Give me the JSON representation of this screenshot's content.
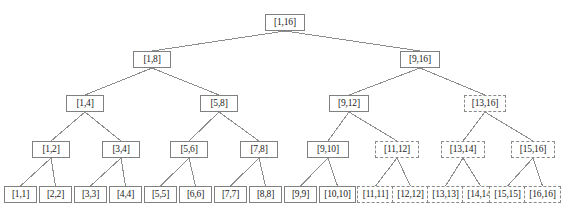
{
  "figure": {
    "name": "segment-tree-diagram",
    "type": "tree",
    "width": 563,
    "height": 209,
    "background": "#ffffff",
    "edge_color": "#8c8c8c",
    "solid_border_color": "#808080",
    "dashed_border_color": "#8a8a8a",
    "text_color": "#1a1a1a"
  },
  "levels": [
    {
      "index": 0,
      "y": 14,
      "height": 17,
      "font_size": 9.5
    },
    {
      "index": 1,
      "y": 51,
      "height": 17,
      "font_size": 9.5
    },
    {
      "index": 2,
      "y": 95,
      "height": 17,
      "font_size": 9.5
    },
    {
      "index": 3,
      "y": 141,
      "height": 17,
      "font_size": 9.5
    },
    {
      "index": 4,
      "y": 186,
      "height": 17,
      "font_size": 9.5
    }
  ],
  "nodes": [
    {
      "id": "n-1-16",
      "label": "[1,16]",
      "level": 0,
      "x": 265,
      "y": 14,
      "w": 40,
      "h": 17,
      "style": "solid",
      "range": [
        1,
        16
      ]
    },
    {
      "id": "n-1-8",
      "label": "[1,8]",
      "level": 1,
      "x": 133,
      "y": 51,
      "w": 38,
      "h": 17,
      "style": "solid",
      "range": [
        1,
        8
      ]
    },
    {
      "id": "n-9-16",
      "label": "[9,16]",
      "level": 1,
      "x": 400,
      "y": 51,
      "w": 40,
      "h": 17,
      "style": "solid",
      "range": [
        9,
        16
      ]
    },
    {
      "id": "n-1-4",
      "label": "[1,4]",
      "level": 2,
      "x": 66,
      "y": 95,
      "w": 38,
      "h": 17,
      "style": "solid",
      "range": [
        1,
        4
      ]
    },
    {
      "id": "n-5-8",
      "label": "[5,8]",
      "level": 2,
      "x": 200,
      "y": 95,
      "w": 38,
      "h": 17,
      "style": "solid",
      "range": [
        5,
        8
      ]
    },
    {
      "id": "n-9-12",
      "label": "[9,12]",
      "level": 2,
      "x": 329,
      "y": 95,
      "w": 40,
      "h": 17,
      "style": "solid",
      "range": [
        9,
        12
      ]
    },
    {
      "id": "n-13-16",
      "label": "[13,16]",
      "level": 2,
      "x": 464,
      "y": 95,
      "w": 42,
      "h": 17,
      "style": "dashed",
      "range": [
        13,
        16
      ]
    },
    {
      "id": "n-1-2",
      "label": "[1,2]",
      "level": 3,
      "x": 32,
      "y": 141,
      "w": 38,
      "h": 17,
      "style": "solid",
      "range": [
        1,
        2
      ]
    },
    {
      "id": "n-3-4",
      "label": "[3,4]",
      "level": 3,
      "x": 102,
      "y": 141,
      "w": 38,
      "h": 17,
      "style": "solid",
      "range": [
        3,
        4
      ]
    },
    {
      "id": "n-5-6",
      "label": "[5,6]",
      "level": 3,
      "x": 170,
      "y": 141,
      "w": 38,
      "h": 17,
      "style": "solid",
      "range": [
        5,
        6
      ]
    },
    {
      "id": "n-7-8",
      "label": "[7,8]",
      "level": 3,
      "x": 240,
      "y": 141,
      "w": 38,
      "h": 17,
      "style": "solid",
      "range": [
        7,
        8
      ]
    },
    {
      "id": "n-9-10",
      "label": "[9,10]",
      "level": 3,
      "x": 307,
      "y": 141,
      "w": 42,
      "h": 17,
      "style": "solid",
      "range": [
        9,
        10
      ]
    },
    {
      "id": "n-11-12",
      "label": "[11,12]",
      "level": 3,
      "x": 375,
      "y": 141,
      "w": 44,
      "h": 17,
      "style": "dashed",
      "range": [
        11,
        12
      ]
    },
    {
      "id": "n-13-14",
      "label": "[13,14]",
      "level": 3,
      "x": 441,
      "y": 141,
      "w": 44,
      "h": 17,
      "style": "dashed",
      "range": [
        13,
        14
      ]
    },
    {
      "id": "n-15-16",
      "label": "[15,16]",
      "level": 3,
      "x": 511,
      "y": 141,
      "w": 44,
      "h": 17,
      "style": "dashed",
      "range": [
        15,
        16
      ]
    },
    {
      "id": "n-1-1",
      "label": "[1,1]",
      "level": 4,
      "x": 4,
      "y": 186,
      "w": 33,
      "h": 17,
      "style": "solid",
      "range": [
        1,
        1
      ]
    },
    {
      "id": "n-2-2",
      "label": "[2,2]",
      "level": 4,
      "x": 39,
      "y": 186,
      "w": 33,
      "h": 17,
      "style": "solid",
      "range": [
        2,
        2
      ]
    },
    {
      "id": "n-3-3",
      "label": "[3,3]",
      "level": 4,
      "x": 74,
      "y": 186,
      "w": 33,
      "h": 17,
      "style": "solid",
      "range": [
        3,
        3
      ]
    },
    {
      "id": "n-4-4",
      "label": "[4,4]",
      "level": 4,
      "x": 109,
      "y": 186,
      "w": 33,
      "h": 17,
      "style": "solid",
      "range": [
        4,
        4
      ]
    },
    {
      "id": "n-5-5",
      "label": "[5,5]",
      "level": 4,
      "x": 144,
      "y": 186,
      "w": 33,
      "h": 17,
      "style": "solid",
      "range": [
        5,
        5
      ]
    },
    {
      "id": "n-6-6",
      "label": "[6,6]",
      "level": 4,
      "x": 179,
      "y": 186,
      "w": 33,
      "h": 17,
      "style": "solid",
      "range": [
        6,
        6
      ]
    },
    {
      "id": "n-7-7",
      "label": "[7,7]",
      "level": 4,
      "x": 214,
      "y": 186,
      "w": 33,
      "h": 17,
      "style": "solid",
      "range": [
        7,
        7
      ]
    },
    {
      "id": "n-8-8",
      "label": "[8,8]",
      "level": 4,
      "x": 249,
      "y": 186,
      "w": 33,
      "h": 17,
      "style": "solid",
      "range": [
        8,
        8
      ]
    },
    {
      "id": "n-9-9",
      "label": "[9,9]",
      "level": 4,
      "x": 284,
      "y": 186,
      "w": 33,
      "h": 17,
      "style": "solid",
      "range": [
        9,
        9
      ]
    },
    {
      "id": "n-10-10",
      "label": "[10,10]",
      "level": 4,
      "x": 319,
      "y": 186,
      "w": 37,
      "h": 17,
      "style": "solid",
      "range": [
        10,
        10
      ]
    },
    {
      "id": "n-11-11",
      "label": "[11,11]",
      "level": 4,
      "x": 357,
      "y": 186,
      "w": 37,
      "h": 17,
      "style": "dashed",
      "range": [
        11,
        11
      ]
    },
    {
      "id": "n-12-12",
      "label": "[12,12]",
      "level": 4,
      "x": 392,
      "y": 186,
      "w": 37,
      "h": 17,
      "style": "dashed",
      "range": [
        12,
        12
      ]
    },
    {
      "id": "n-13-13",
      "label": "[13,13]",
      "level": 4,
      "x": 427,
      "y": 186,
      "w": 37,
      "h": 17,
      "style": "dashed",
      "range": [
        13,
        13
      ]
    },
    {
      "id": "n-14-14",
      "label": "[14,14]",
      "level": 4,
      "x": 462,
      "y": 186,
      "w": 37,
      "h": 17,
      "style": "dashed",
      "range": [
        14,
        14
      ]
    },
    {
      "id": "n-15-15",
      "label": "[15,15]",
      "level": 4,
      "x": 489,
      "y": 186,
      "w": 37,
      "h": 17,
      "style": "dashed",
      "range": [
        15,
        15
      ]
    },
    {
      "id": "n-16-16",
      "label": "[16,16]",
      "level": 4,
      "x": 524,
      "y": 186,
      "w": 37,
      "h": 17,
      "style": "dashed",
      "range": [
        16,
        16
      ]
    }
  ],
  "edges": [
    {
      "from": "n-1-16",
      "to": "n-1-8"
    },
    {
      "from": "n-1-16",
      "to": "n-9-16"
    },
    {
      "from": "n-1-8",
      "to": "n-1-4"
    },
    {
      "from": "n-1-8",
      "to": "n-5-8"
    },
    {
      "from": "n-9-16",
      "to": "n-9-12"
    },
    {
      "from": "n-9-16",
      "to": "n-13-16"
    },
    {
      "from": "n-1-4",
      "to": "n-1-2"
    },
    {
      "from": "n-1-4",
      "to": "n-3-4"
    },
    {
      "from": "n-5-8",
      "to": "n-5-6"
    },
    {
      "from": "n-5-8",
      "to": "n-7-8"
    },
    {
      "from": "n-9-12",
      "to": "n-9-10"
    },
    {
      "from": "n-9-12",
      "to": "n-11-12"
    },
    {
      "from": "n-13-16",
      "to": "n-13-14"
    },
    {
      "from": "n-13-16",
      "to": "n-15-16"
    },
    {
      "from": "n-1-2",
      "to": "n-1-1"
    },
    {
      "from": "n-1-2",
      "to": "n-2-2"
    },
    {
      "from": "n-3-4",
      "to": "n-3-3"
    },
    {
      "from": "n-3-4",
      "to": "n-4-4"
    },
    {
      "from": "n-5-6",
      "to": "n-5-5"
    },
    {
      "from": "n-5-6",
      "to": "n-6-6"
    },
    {
      "from": "n-7-8",
      "to": "n-7-7"
    },
    {
      "from": "n-7-8",
      "to": "n-8-8"
    },
    {
      "from": "n-9-10",
      "to": "n-9-9"
    },
    {
      "from": "n-9-10",
      "to": "n-10-10"
    },
    {
      "from": "n-11-12",
      "to": "n-11-11"
    },
    {
      "from": "n-11-12",
      "to": "n-12-12"
    },
    {
      "from": "n-13-14",
      "to": "n-13-13"
    },
    {
      "from": "n-13-14",
      "to": "n-14-14"
    },
    {
      "from": "n-15-16",
      "to": "n-15-15"
    },
    {
      "from": "n-15-16",
      "to": "n-16-16"
    }
  ]
}
